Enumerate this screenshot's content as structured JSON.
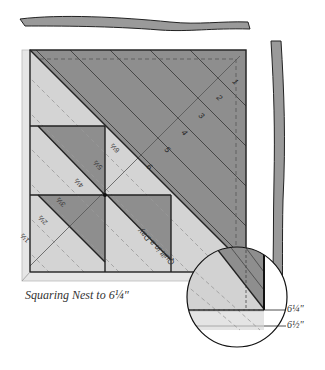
{
  "caption": "Squaring Nest to 6¼\"",
  "callouts": {
    "inner": "6¼\"",
    "outer": "6½\""
  },
  "ruler": {
    "diagonal_numbers": [
      "1",
      "2",
      "3",
      "4",
      "5",
      "6"
    ],
    "side_marks": [
      "1½",
      "2½",
      "3½",
      "4½",
      "5½",
      "6½"
    ],
    "logo": "Quilt in a Day"
  },
  "colors": {
    "dark": "#8c8c8c",
    "mid": "#a3a3a3",
    "light": "#d6d6d6",
    "ruler": "#e4e4e4",
    "line": "#222222"
  }
}
